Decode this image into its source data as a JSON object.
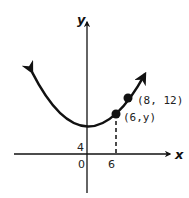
{
  "diagram": {
    "type": "parabola-graph",
    "axes": {
      "x_label": "x",
      "y_label": "y"
    },
    "ticks": {
      "y_intercept": "4",
      "origin": "0",
      "x_tick": "6"
    },
    "points": [
      {
        "label": "(6,y)",
        "x": 6,
        "y": "y"
      },
      {
        "label": "(8, 12)",
        "x": 8,
        "y": 12
      }
    ],
    "colors": {
      "curve": "#111111",
      "axis": "#111111"
    }
  }
}
